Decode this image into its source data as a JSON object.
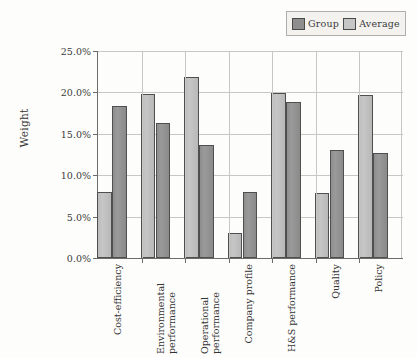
{
  "chart_data": {
    "type": "bar",
    "title": "",
    "xlabel": "",
    "ylabel": "Weight",
    "ylim": [
      0,
      25
    ],
    "ytick_labels": [
      "0.0%",
      "5.0%",
      "10.0%",
      "15.0%",
      "20.0%",
      "25.0%"
    ],
    "ytick_values": [
      0,
      5,
      10,
      15,
      20,
      25
    ],
    "grid": true,
    "legend_position": "top-right",
    "categories": [
      "Cost-efficiency",
      "Environmental performance",
      "Operational performance",
      "Company profile",
      "H&S performance",
      "Quality",
      "Policy"
    ],
    "category_lines": [
      [
        "Cost-efficiency"
      ],
      [
        "Environmental",
        "performance"
      ],
      [
        "Operational",
        "performance"
      ],
      [
        "Company profile"
      ],
      [
        "H&S performance"
      ],
      [
        "Quality"
      ],
      [
        "Policy"
      ]
    ],
    "series": [
      {
        "name": "Average",
        "color": "#bdbdbd",
        "values": [
          8.0,
          19.8,
          21.9,
          3.0,
          19.9,
          7.8,
          19.7
        ]
      },
      {
        "name": "Group",
        "color": "#8e8e8e",
        "values": [
          18.3,
          16.3,
          13.6,
          8.0,
          18.8,
          13.0,
          12.7
        ]
      }
    ]
  },
  "legend": {
    "entries": [
      {
        "label": "Group",
        "color": "#8e8e8e"
      },
      {
        "label": "Average",
        "color": "#bdbdbd"
      }
    ]
  },
  "axes": {
    "y_title": "Weight"
  }
}
